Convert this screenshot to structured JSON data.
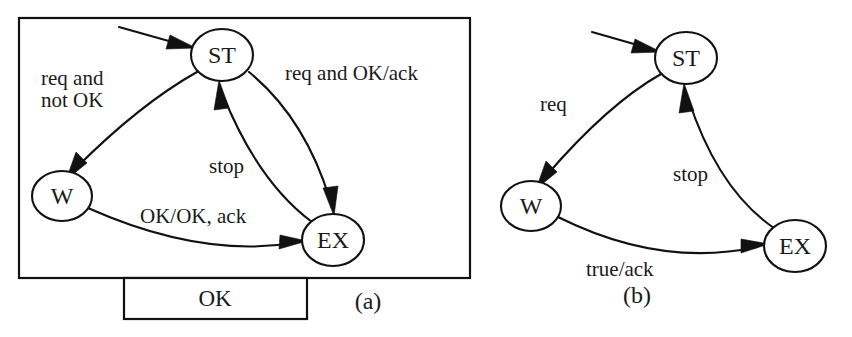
{
  "figure": {
    "background_color": "#ffffff",
    "ink_color": "#111111",
    "panels": [
      {
        "id": "a",
        "caption": "(a)",
        "has_boundary_box": true,
        "port": {
          "label": "OK"
        },
        "states": [
          {
            "id": "ST",
            "label": "ST"
          },
          {
            "id": "W",
            "label": "W"
          },
          {
            "id": "EX",
            "label": "EX"
          }
        ],
        "initial_marker": true,
        "transitions": [
          {
            "from": "ST",
            "to": "W",
            "label": "req and\nnot OK",
            "label_line1": "req and",
            "label_line2": "not OK"
          },
          {
            "from": "ST",
            "to": "EX",
            "label": "req and OK/ack"
          },
          {
            "from": "W",
            "to": "EX",
            "label": "OK/OK, ack"
          },
          {
            "from": "EX",
            "to": "ST",
            "label": "stop"
          }
        ]
      },
      {
        "id": "b",
        "caption": "(b)",
        "has_boundary_box": false,
        "states": [
          {
            "id": "ST",
            "label": "ST"
          },
          {
            "id": "W",
            "label": "W"
          },
          {
            "id": "EX",
            "label": "EX"
          }
        ],
        "initial_marker": true,
        "transitions": [
          {
            "from": "ST",
            "to": "W",
            "label": "req"
          },
          {
            "from": "W",
            "to": "EX",
            "label": "true/ack"
          },
          {
            "from": "EX",
            "to": "ST",
            "label": "stop"
          }
        ]
      }
    ]
  }
}
